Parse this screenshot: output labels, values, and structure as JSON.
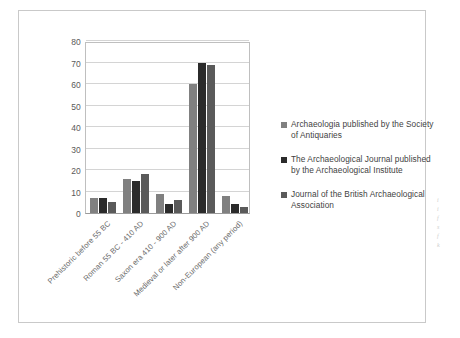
{
  "chart_data": {
    "type": "bar",
    "title": "",
    "xlabel": "",
    "ylabel": "",
    "ylim": [
      0,
      80
    ],
    "yticks": [
      0,
      10,
      20,
      30,
      40,
      50,
      60,
      70,
      80
    ],
    "grid": true,
    "legend_position": "right",
    "categories": [
      "Prehistoric before 55 BC",
      "Roman 55 BC - 410 AD",
      "Saxon era 410 - 900 AD",
      "Medieval or later after 900 AD",
      "Non-European (any period)"
    ],
    "series": [
      {
        "name": "Archaeologia published by the Society of Antiquaries",
        "color": "#808080",
        "values": [
          7,
          16,
          9,
          60,
          8
        ]
      },
      {
        "name": "The Archaeological Journal published by the Archaeological Institute",
        "color": "#2b2b2b",
        "values": [
          7,
          15,
          4,
          70,
          4
        ]
      },
      {
        "name": "Journal of the British Archaeological Association",
        "color": "#5a5a5a",
        "values": [
          5,
          18,
          6,
          69,
          3
        ]
      }
    ]
  },
  "legend": {
    "entries": [
      "Archaeologia published by the Society of Antiquaries",
      "The Archaeological Journal published by the Archaeological Institute",
      "Journal of the British Archaeological Association"
    ]
  },
  "edge_marks": {
    "lines": [
      "i",
      "i",
      "f",
      "",
      "s",
      "f",
      "k"
    ]
  }
}
